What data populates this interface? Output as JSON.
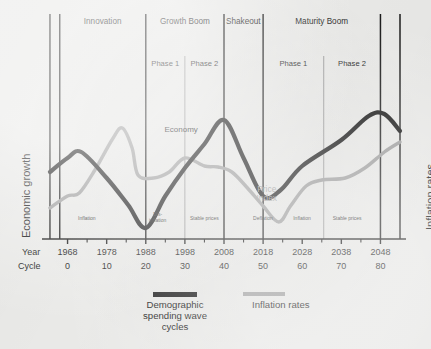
{
  "chart_data": {
    "type": "line",
    "title": "",
    "xlabel": "",
    "ylabel": "Economic growth",
    "y2label": "Inflation rates",
    "grid": false,
    "legend_position": "bottom",
    "x": [
      1968,
      1978,
      1988,
      1998,
      2008,
      2018,
      2028,
      2038,
      2048
    ],
    "cycle": [
      0,
      10,
      20,
      30,
      40,
      50,
      60,
      70,
      80
    ],
    "xlim": [
      1963,
      2053
    ],
    "series": [
      {
        "name": "Demographic spending wave cycles",
        "inline_label": "Economy",
        "color": "#131313",
        "points": [
          [
            1963.5,
            172
          ],
          [
            1968.0,
            158
          ],
          [
            1971.5,
            152
          ],
          [
            1978.0,
            178
          ],
          [
            1983.5,
            205
          ],
          [
            1988.0,
            228
          ],
          [
            1993.0,
            196
          ],
          [
            1998.0,
            168
          ],
          [
            2003.0,
            144
          ],
          [
            2008.0,
            120
          ],
          [
            2013.0,
            158
          ],
          [
            2018.0,
            196
          ],
          [
            2022.5,
            190
          ],
          [
            2028.0,
            166
          ],
          [
            2038.0,
            140
          ],
          [
            2045.0,
            116
          ],
          [
            2049.0,
            114
          ],
          [
            2053.0,
            131
          ]
        ]
      },
      {
        "name": "Inflation rates",
        "inline_label": "Price Index",
        "color": "#9b9b9b",
        "points": [
          [
            1963.5,
            208
          ],
          [
            1968.0,
            196
          ],
          [
            1971.0,
            193
          ],
          [
            1975.0,
            170
          ],
          [
            1979.5,
            139
          ],
          [
            1982.0,
            128
          ],
          [
            1984.5,
            148
          ],
          [
            1986.0,
            175
          ],
          [
            1990.0,
            178
          ],
          [
            1994.0,
            172
          ],
          [
            1998.0,
            158
          ],
          [
            2003.0,
            166
          ],
          [
            2006.5,
            167
          ],
          [
            2010.0,
            172
          ],
          [
            2014.0,
            188
          ],
          [
            2018.0,
            206
          ],
          [
            2022.0,
            222
          ],
          [
            2025.0,
            206
          ],
          [
            2029.0,
            186
          ],
          [
            2033.0,
            180
          ],
          [
            2039.0,
            178
          ],
          [
            2044.0,
            168
          ],
          [
            2049.0,
            152
          ],
          [
            2053.0,
            142
          ]
        ]
      }
    ],
    "eras": [
      {
        "label": "Innovation",
        "start": 1966.0,
        "end": 1988.0
      },
      {
        "label": "Growth Boom",
        "start": 1988.0,
        "end": 2008.0
      },
      {
        "label": "Shakeout",
        "start": 2008.0,
        "end": 2018.0
      },
      {
        "label": "Maturity Boom",
        "start": 2018.0,
        "end": 2048.0
      }
    ],
    "phases": [
      {
        "label": "Phase 1",
        "start": 1988.0,
        "end": 1998.0
      },
      {
        "label": "Phase 2",
        "start": 1998.0,
        "end": 2008.0
      },
      {
        "label": "Phase 1",
        "start": 2018.0,
        "end": 2033.5
      },
      {
        "label": "Phase 2",
        "start": 2033.5,
        "end": 2048.0
      }
    ],
    "regimes": [
      {
        "label": "Inflation",
        "center": 1973.0
      },
      {
        "label": "Dis-\ninflation",
        "center": 1991.0
      },
      {
        "label": "Stable prices",
        "center": 2003.0
      },
      {
        "label": "Deflation",
        "center": 2018.0
      },
      {
        "label": "Inflation",
        "center": 2028.0
      },
      {
        "label": "Stable prices",
        "center": 2039.5
      }
    ],
    "major_dividers": [
      1963.5,
      1966.0,
      1988.0,
      2008.0,
      2018.0,
      2048.0,
      2053.0
    ],
    "minor_dividers": [
      1998.0,
      2033.5
    ],
    "annotations": [
      {
        "text": "Economy",
        "x": 1997.0,
        "y": 126,
        "color": "#111111"
      },
      {
        "text": "Price Index",
        "x": 2019.0,
        "y": 185,
        "color": "#9a9a9a"
      }
    ]
  },
  "axis": {
    "year_label": "Year",
    "cycle_label": "Cycle",
    "year_ticks": [
      "1968",
      "1978",
      "1988",
      "1998",
      "2008",
      "2018",
      "2028",
      "2038",
      "2048"
    ],
    "cycle_ticks": [
      "0",
      "10",
      "20",
      "30",
      "40",
      "50",
      "60",
      "70",
      "80"
    ],
    "left_title": "Economic growth",
    "right_title": "Inflation rates"
  },
  "legend": {
    "items": [
      {
        "label": "Demographic\nspending wave\ncycles",
        "color": "#131313"
      },
      {
        "label": "Inflation rates",
        "color": "#9b9b9b"
      }
    ]
  },
  "colors": {
    "background": "#e9e9e7",
    "black_curve": "#131313",
    "gray_curve": "#9b9b9b",
    "axis": "#141414",
    "divider": "#1b1b1b",
    "minor_divider": "#8d8d8d"
  }
}
